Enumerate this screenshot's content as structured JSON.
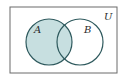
{
  "diagram": {
    "type": "venn",
    "universe_label": "U",
    "sets": [
      {
        "name": "A",
        "label": "A",
        "shaded": true
      },
      {
        "name": "B",
        "label": "B",
        "shaded": false
      }
    ],
    "shaded_region": "A",
    "colors": {
      "shade": "#c7dfe0",
      "stroke": "#2f5a5e",
      "border": "#6a6a6a",
      "background": "#ffffff"
    }
  }
}
